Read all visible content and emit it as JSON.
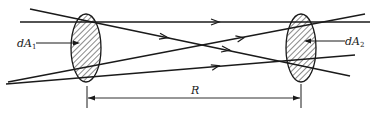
{
  "diagram": {
    "colors": {
      "stroke": "#1a1a1a",
      "ellipse_fill": "#d9d9d9",
      "hatch": "#3a3a3a",
      "background": "#ffffff"
    },
    "labels": {
      "area1": "dA",
      "area1_sub": "1",
      "area2": "dA",
      "area2_sub": "2",
      "distance": "R"
    },
    "elements": {
      "area1_ellipse": {
        "cx": 86,
        "cy": 48,
        "rx": 15,
        "ry": 34
      },
      "area2_ellipse": {
        "cx": 301,
        "cy": 48,
        "rx": 15,
        "ry": 34
      },
      "rays": [
        {
          "x1": 20,
          "y1": 22,
          "x2": 370,
          "y2": 22,
          "arrow_at": 215
        },
        {
          "x1": 30,
          "y1": 9,
          "x2": 350,
          "y2": 76,
          "arrow_at": 165
        },
        {
          "x1": 8,
          "y1": 82,
          "x2": 365,
          "y2": 14,
          "arrow_at": 240
        },
        {
          "x1": 6,
          "y1": 84,
          "x2": 355,
          "y2": 55,
          "arrow_at": 215
        }
      ],
      "dimension_line": {
        "x1": 87,
        "x2": 301,
        "y": 98
      }
    }
  }
}
